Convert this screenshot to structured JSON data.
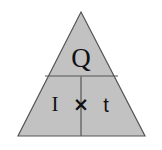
{
  "figure": {
    "kind": "formula-triangle",
    "background_color": "#ffffff"
  },
  "triangle": {
    "fill_color": "#c2c2c2",
    "stroke_color": "#555555",
    "stroke_width": "1.2",
    "apex": {
      "x": 81,
      "y": 12
    },
    "bottom_left": {
      "x": 18,
      "y": 136
    },
    "bottom_right": {
      "x": 145,
      "y": 136
    },
    "horizontal_divider": {
      "x1": 45,
      "y1": 76,
      "x2": 118,
      "y2": 76
    },
    "vertical_divider": {
      "x1": 81,
      "y1": 76,
      "x2": 81,
      "y2": 136
    }
  },
  "cells": {
    "top": {
      "name": "quantity",
      "label": "Q"
    },
    "bottom_left": {
      "name": "current",
      "label": "I"
    },
    "operator": {
      "name": "multiply",
      "label": "×"
    },
    "bottom_right": {
      "name": "time",
      "label": "t"
    }
  }
}
